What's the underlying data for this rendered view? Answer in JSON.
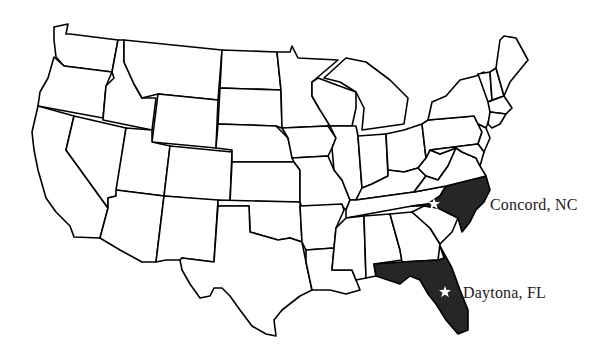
{
  "map": {
    "type": "us-states-outline",
    "background": "#ffffff",
    "outline_color": "#000000",
    "highlight_color": "#262626",
    "highlighted_states": [
      "North Carolina",
      "Florida"
    ],
    "markers": [
      {
        "name": "Concord, NC",
        "label": "Concord, NC",
        "icon": "star-icon",
        "state": "North Carolina",
        "x": 434,
        "y": 204
      },
      {
        "name": "Daytona, FL",
        "label": "Daytona, FL",
        "icon": "star-icon",
        "state": "Florida",
        "x": 445,
        "y": 292
      }
    ]
  }
}
